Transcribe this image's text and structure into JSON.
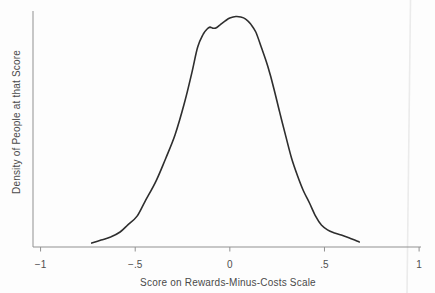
{
  "colors": {
    "background": "#fdfdfd",
    "curve": "#2e2e2e",
    "axis": "#919191",
    "text": "#4f4f4f",
    "artifact_line": "#ebebeb"
  },
  "chart_data": {
    "type": "line",
    "title": "",
    "xlabel": "Score on Rewards-Minus-Costs Scale",
    "ylabel": "Density of People at that Score",
    "xlim": [
      -1.04,
      1.01
    ],
    "ylim": [
      0,
      1.024
    ],
    "grid": false,
    "legend": "none",
    "xticks": [
      -1,
      -0.5,
      0,
      0.5,
      1
    ],
    "xtick_labels": [
      "−1",
      "−.5",
      "0",
      ".5",
      "1"
    ],
    "yticks": [],
    "series": [
      {
        "name": "kernel-density-estimate",
        "x": [
          -0.73,
          -0.68,
          -0.63,
          -0.58,
          -0.54,
          -0.49,
          -0.45,
          -0.39,
          -0.34,
          -0.29,
          -0.24,
          -0.2,
          -0.17,
          -0.14,
          -0.12,
          -0.105,
          -0.09,
          -0.074,
          -0.053,
          -0.026,
          0.0,
          0.032,
          0.058,
          0.084,
          0.11,
          0.137,
          0.168,
          0.2,
          0.232,
          0.263,
          0.295,
          0.326,
          0.358,
          0.389,
          0.421,
          0.453,
          0.484,
          0.516,
          0.553,
          0.589,
          0.632,
          0.684
        ],
        "y": [
          0.017,
          0.03,
          0.043,
          0.065,
          0.095,
          0.134,
          0.195,
          0.286,
          0.382,
          0.486,
          0.625,
          0.759,
          0.868,
          0.924,
          0.946,
          0.954,
          0.95,
          0.95,
          0.963,
          0.98,
          0.993,
          1.0,
          0.998,
          0.989,
          0.967,
          0.933,
          0.863,
          0.785,
          0.69,
          0.586,
          0.482,
          0.386,
          0.308,
          0.243,
          0.191,
          0.134,
          0.095,
          0.074,
          0.061,
          0.052,
          0.039,
          0.022
        ]
      }
    ]
  }
}
